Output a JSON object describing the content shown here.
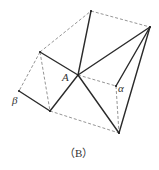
{
  "figure": {
    "caption": "（B）",
    "labels": {
      "center": "A",
      "alpha": "α",
      "beta": "β"
    },
    "points": {
      "top": [
        91,
        11
      ],
      "right_top": [
        150,
        27
      ],
      "left_upper": [
        40,
        52
      ],
      "A": [
        78,
        75
      ],
      "alpha": [
        116,
        86
      ],
      "beta": [
        19,
        91
      ],
      "bottom_left": [
        50,
        111
      ],
      "bottom_right": [
        119,
        133
      ]
    },
    "solid_segments": [
      [
        "A",
        "top"
      ],
      [
        "A",
        "right_top"
      ],
      [
        "A",
        "left_upper"
      ],
      [
        "A",
        "bottom_left"
      ],
      [
        "A",
        "bottom_right"
      ],
      [
        "alpha",
        "right_top"
      ],
      [
        "bottom_right",
        "right_top"
      ],
      [
        "beta",
        "bottom_left"
      ]
    ],
    "dashed_segments": [
      [
        "top",
        "right_top"
      ],
      [
        "left_upper",
        "top"
      ],
      [
        "left_upper",
        "beta"
      ],
      [
        "left_upper",
        "bottom_left"
      ],
      [
        "A",
        "alpha"
      ],
      [
        "alpha",
        "bottom_right"
      ],
      [
        "bottom_left",
        "bottom_right"
      ]
    ]
  }
}
